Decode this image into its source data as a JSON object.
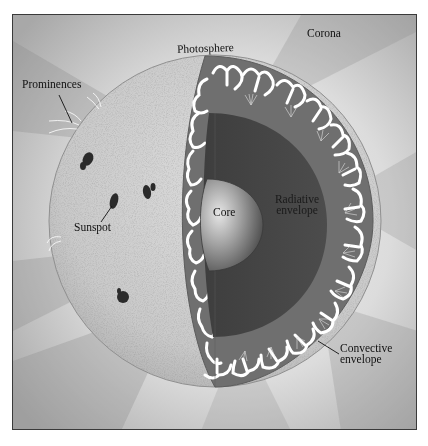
{
  "figure": {
    "colors": {
      "background_light": "#e8e8e8",
      "background_shadow": "#8c8c8c",
      "photosphere_surface": "#cfcfcf",
      "convective_zone": "#6e6e6e",
      "radiative_zone": "#474747",
      "core_highlight": "#cfcfcf",
      "core_shadow": "#4a4a4a",
      "convection_arrows": "#ffffff",
      "sunspot": "#2a2a2a",
      "frame_border": "#3a3a3a"
    },
    "labels": {
      "corona": "Corona",
      "photosphere": "Photosphere",
      "prominences": "Prominences",
      "sunspot": "Sunspot",
      "core": "Core",
      "radiative_line1": "Radiative",
      "radiative_line2": "envelope",
      "convective_line1": "Convective",
      "convective_line2": "envelope"
    }
  }
}
